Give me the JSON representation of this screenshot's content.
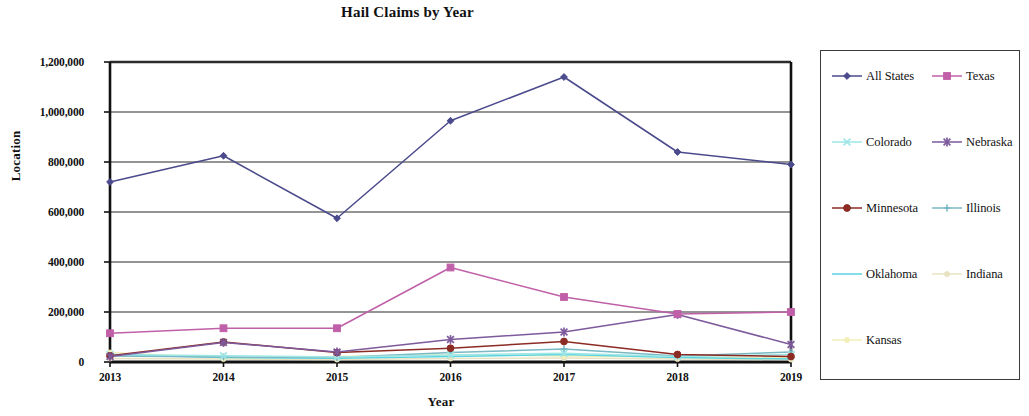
{
  "chart_data": {
    "type": "line",
    "title": "Hail Claims by Year",
    "xlabel": "Year",
    "ylabel": "Location",
    "x": [
      2013,
      2014,
      2015,
      2016,
      2017,
      2018,
      2019
    ],
    "categories": [
      "2013",
      "2014",
      "2015",
      "2016",
      "2017",
      "2018",
      "2019"
    ],
    "ylim": [
      0,
      1200000
    ],
    "ytick_values": [
      0,
      200000,
      400000,
      600000,
      800000,
      1000000,
      1200000
    ],
    "ytick_labels": [
      "0",
      "200,000",
      "400,000",
      "600,000",
      "800,000",
      "1,000,000",
      "1,200,000"
    ],
    "grid": "horizontal",
    "legend_position": "right",
    "legend_columns": 2,
    "series": [
      {
        "name": "All States",
        "color": "#4a4a8c",
        "marker": "diamond",
        "values": [
          720000,
          825000,
          575000,
          965000,
          1140000,
          840000,
          790000
        ]
      },
      {
        "name": "Texas",
        "color": "#c060a8",
        "marker": "square",
        "values": [
          115000,
          135000,
          135000,
          378000,
          260000,
          192000,
          200000
        ]
      },
      {
        "name": "Colorado",
        "color": "#9fe6e6",
        "marker": "x",
        "values": [
          30000,
          25000,
          20000,
          28000,
          35000,
          22000,
          30000
        ]
      },
      {
        "name": "Nebraska",
        "color": "#7d5a9c",
        "marker": "star",
        "values": [
          22000,
          78000,
          40000,
          90000,
          120000,
          190000,
          70000
        ]
      },
      {
        "name": "Minnesota",
        "color": "#8c2b24",
        "marker": "circle",
        "values": [
          25000,
          80000,
          38000,
          55000,
          82000,
          30000,
          22000
        ]
      },
      {
        "name": "Illinois",
        "color": "#7ab8c4",
        "marker": "plus",
        "values": [
          24000,
          20000,
          18000,
          38000,
          52000,
          24000,
          40000
        ]
      },
      {
        "name": "Oklahoma",
        "color": "#5ad3e0",
        "marker": "line",
        "values": [
          30000,
          18000,
          15000,
          22000,
          30000,
          18000,
          12000
        ]
      },
      {
        "name": "Indiana",
        "color": "#e8e2c0",
        "marker": "dot",
        "values": [
          14000,
          12000,
          10000,
          14000,
          16000,
          12000,
          10000
        ]
      },
      {
        "name": "Kansas",
        "color": "#f2efb8",
        "marker": "dot",
        "values": [
          38000,
          16000,
          22000,
          30000,
          24000,
          20000,
          18000
        ]
      }
    ]
  }
}
